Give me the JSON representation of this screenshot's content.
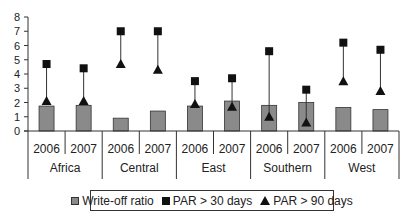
{
  "chart_data": {
    "type": "bar",
    "title": "",
    "xlabel": "",
    "ylabel": "",
    "ylim": [
      0,
      8
    ],
    "yticks": [
      0,
      1,
      2,
      3,
      4,
      5,
      6,
      7,
      8
    ],
    "grid": false,
    "legend_position": "bottom",
    "groups": [
      "Africa",
      "Central",
      "East",
      "Southern",
      "West"
    ],
    "categories": [
      "2006",
      "2007",
      "2006",
      "2007",
      "2006",
      "2007",
      "2006",
      "2007",
      "2006",
      "2007"
    ],
    "series": [
      {
        "name": "Write-off ratio",
        "style": "bar",
        "values": [
          1.75,
          1.8,
          0.9,
          1.4,
          1.75,
          2.1,
          1.8,
          2.0,
          1.65,
          1.5
        ]
      },
      {
        "name": "PAR > 30 days",
        "style": "square-marker",
        "values": [
          4.7,
          4.4,
          7.0,
          7.0,
          3.5,
          3.7,
          5.6,
          2.9,
          6.2,
          5.7
        ]
      },
      {
        "name": "PAR > 90 days",
        "style": "triangle-marker",
        "values": [
          2.1,
          2.1,
          4.7,
          4.3,
          1.9,
          1.7,
          1.0,
          0.6,
          3.5,
          2.8
        ]
      }
    ],
    "annotations": [
      "vertical line connecting PAR > 30 days and PAR > 90 days markers per category"
    ]
  },
  "legend": {
    "items": [
      {
        "label": "Write-off ratio",
        "icon": "gray-square-swatch"
      },
      {
        "label": "PAR > 30 days",
        "icon": "black-square-marker"
      },
      {
        "label": "PAR > 90 days",
        "icon": "black-triangle-marker"
      }
    ]
  },
  "colors": {
    "bar": "#8a8a8a",
    "bar_border": "#333333",
    "marker": "#111111",
    "axis": "#333333"
  }
}
